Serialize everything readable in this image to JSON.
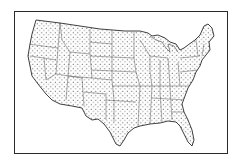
{
  "map": {
    "subject": "Contiguous United States",
    "style": "dot distribution map with state boundaries",
    "colors": {
      "ink": "#2a2a2a",
      "background": "#ffffff",
      "dots": "#333333"
    },
    "frame": {
      "x": 14,
      "y": 11,
      "width": 214,
      "height": 143
    }
  }
}
